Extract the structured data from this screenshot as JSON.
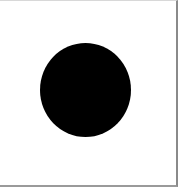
{
  "figure": {
    "background_color": "#ffffff",
    "frame_border_color": "#8a8a8a",
    "shapes": [
      {
        "type": "circle",
        "fill": "#000000",
        "center_x": 85,
        "center_y": 90,
        "width": 91,
        "height": 94
      }
    ]
  }
}
